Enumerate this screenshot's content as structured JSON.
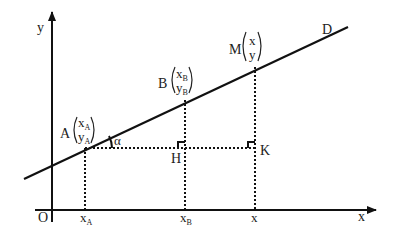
{
  "diagram": {
    "axes": {
      "x_label": "x",
      "y_label": "y",
      "origin_label": "O"
    },
    "line_label": "D",
    "angle_label": "α",
    "points": {
      "A": {
        "name": "A",
        "x_sym": "x",
        "x_sub": "A",
        "y_sym": "y",
        "y_sub": "A"
      },
      "B": {
        "name": "B",
        "x_sym": "x",
        "x_sub": "B",
        "y_sym": "y",
        "y_sub": "B"
      },
      "M": {
        "name": "M",
        "x_sym": "x",
        "y_sym": "y"
      }
    },
    "foot_points": {
      "H": "H",
      "K": "K"
    },
    "x_ticks": [
      {
        "sym": "x",
        "sub": "A"
      },
      {
        "sym": "x",
        "sub": "B"
      },
      {
        "sym": "x",
        "sub": ""
      }
    ],
    "colors": {
      "stroke": "#111111",
      "text": "#222222",
      "background": "#ffffff"
    }
  }
}
